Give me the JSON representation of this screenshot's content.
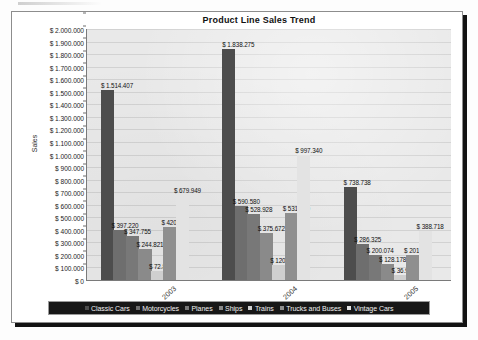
{
  "chart_data": {
    "type": "bar",
    "title": "Product Line Sales Trend",
    "xlabel": "",
    "ylabel": "Sales",
    "categories": [
      "2003",
      "2004",
      "2005"
    ],
    "ylim": [
      0,
      2000000
    ],
    "ytick_step": 100000,
    "ytick_labels": [
      "$ 2.000.000",
      "$ 1.900.000",
      "$ 1.800.000",
      "$ 1.700.000",
      "$ 1.600.000",
      "$ 1.500.000",
      "$ 1.400.000",
      "$ 1.300.000",
      "$ 1.200.000",
      "$ 1.100.000",
      "$ 1.000.000",
      "$ 900.000",
      "$ 800.000",
      "$ 700.000",
      "$ 600.000",
      "$ 500.000",
      "$ 400.000",
      "$ 300.000",
      "$ 200.000",
      "$ 100.000",
      "$ 0"
    ],
    "grid": true,
    "legend_position": "bottom",
    "series": [
      {
        "name": "Classic Cars",
        "color": "#4d4d4d",
        "values": [
          1514407,
          1838275,
          738738
        ],
        "labels": [
          "$ 1.514.407",
          "$ 1.838.275",
          "$ 738.738"
        ]
      },
      {
        "name": "Motorcycles",
        "color": "#6e6e6e",
        "values": [
          397220,
          590580,
          286325
        ],
        "labels": [
          "$ 397.220",
          "$ 590.580",
          "$ 286.325"
        ]
      },
      {
        "name": "Planes",
        "color": "#787878",
        "values": [
          347755,
          528928,
          200074
        ],
        "labels": [
          "$ 347.755",
          "$ 528.928",
          "$ 200.074"
        ]
      },
      {
        "name": "Ships",
        "color": "#8a8a8a",
        "values": [
          244821,
          375672,
          128178
        ],
        "labels": [
          "$ 244.821",
          "$ 375.672",
          "$ 128.178"
        ]
      },
      {
        "name": "Trains",
        "color": "#cfcfcf",
        "values": [
          72800,
          120300,
          36900
        ],
        "labels": [
          "$ 72.800",
          "$ 120.300",
          "$ 36.900"
        ]
      },
      {
        "name": "Trucks and Buses",
        "color": "#8f8f8f",
        "values": [
          420400,
          531500,
          201600
        ],
        "labels": [
          "$ 420.400",
          "$ 531.500",
          "$ 201.600"
        ]
      },
      {
        "name": "Vintage Cars",
        "color": "#e3e3e3",
        "values": [
          679949,
          997340,
          388718
        ],
        "labels": [
          "$ 679.949",
          "$ 997.340",
          "$ 388.718"
        ]
      }
    ]
  },
  "legend": {
    "items": [
      "Classic Cars",
      "Motorcycles",
      "Planes",
      "Ships",
      "Trains",
      "Trucks and Buses",
      "Vintage Cars"
    ]
  },
  "colors": {
    "plot_background": "#e9e9e9",
    "frame_background": "#ffffff",
    "legend_background": "#171717",
    "gridline": "#d2d2d2",
    "axis": "#7a7a7a"
  }
}
